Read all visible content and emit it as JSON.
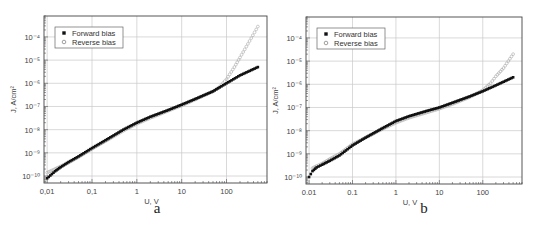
{
  "figure": {
    "panels": [
      "a",
      "b"
    ]
  },
  "chart_data": [
    {
      "type": "scatter",
      "panel_label": "a",
      "title": "",
      "xlabel": "U, V",
      "ylabel": "J, A/cm²",
      "xscale": "log",
      "yscale": "log",
      "xlim": [
        0.0085,
        800
      ],
      "ylim": [
        5e-11,
        0.0008
      ],
      "x_ticks": [
        0.01,
        0.1,
        1,
        10,
        100
      ],
      "x_tick_labels": [
        "0,01",
        "0,1",
        "1",
        "10",
        "100"
      ],
      "y_ticks": [
        1e-10,
        1e-09,
        1e-08,
        1e-07,
        1e-06,
        1e-05,
        0.0001
      ],
      "y_tick_labels": [
        "10⁻¹⁰",
        "10⁻⁹",
        "10⁻⁸",
        "10⁻⁷",
        "10⁻⁶",
        "10⁻⁵",
        "10⁻⁴"
      ],
      "grid": true,
      "legend_position": "upper left",
      "series": [
        {
          "name": "Forward bias",
          "marker": "filled-square",
          "color": "#111111",
          "x": [
            0.01,
            0.015,
            0.02,
            0.03,
            0.05,
            0.1,
            0.2,
            0.5,
            1,
            2,
            5,
            10,
            20,
            50,
            100,
            200,
            500
          ],
          "y": [
            8e-11,
            1.6e-10,
            2.4e-10,
            4e-10,
            7e-10,
            1.6e-09,
            3.5e-09,
            1e-08,
            2e-08,
            3.6e-08,
            7e-08,
            1.2e-07,
            2.1e-07,
            4.5e-07,
            1e-06,
            2.2e-06,
            5e-06
          ]
        },
        {
          "name": "Reverse bias",
          "marker": "open-circle",
          "color": "#aaaaaa",
          "x": [
            0.01,
            0.015,
            0.02,
            0.03,
            0.05,
            0.1,
            0.2,
            0.5,
            1,
            2,
            5,
            10,
            20,
            50,
            70,
            100,
            150,
            200,
            300,
            500
          ],
          "y": [
            1.4e-10,
            2e-10,
            2.6e-10,
            3.8e-10,
            6.5e-10,
            1.5e-09,
            3.2e-09,
            9e-09,
            1.8e-08,
            3.2e-08,
            6.5e-08,
            1.1e-07,
            2e-07,
            4.5e-07,
            7e-07,
            1.5e-06,
            5e-06,
            1.3e-05,
            5e-05,
            0.00028
          ]
        }
      ]
    },
    {
      "type": "scatter",
      "panel_label": "b",
      "title": "",
      "xlabel": "U, V",
      "ylabel": "J, A/cm²",
      "xscale": "log",
      "yscale": "log",
      "xlim": [
        0.0085,
        800
      ],
      "ylim": [
        5e-11,
        0.0008
      ],
      "x_ticks": [
        0.01,
        0.1,
        1,
        10,
        100
      ],
      "x_tick_labels": [
        "0.01",
        "0.1",
        "1",
        "10",
        "100"
      ],
      "y_ticks": [
        1e-10,
        1e-09,
        1e-08,
        1e-07,
        1e-06,
        1e-05,
        0.0001
      ],
      "y_tick_labels": [
        "10⁻¹⁰",
        "10⁻⁹",
        "10⁻⁸",
        "10⁻⁷",
        "10⁻⁶",
        "10⁻⁵",
        "10⁻⁴"
      ],
      "grid": true,
      "legend_position": "upper left",
      "series": [
        {
          "name": "Forward bias",
          "marker": "filled-square",
          "color": "#111111",
          "x": [
            0.01,
            0.012,
            0.015,
            0.02,
            0.03,
            0.05,
            0.1,
            0.2,
            0.5,
            1,
            2,
            5,
            10,
            20,
            50,
            100,
            200,
            500
          ],
          "y": [
            1e-10,
            1.8e-10,
            2.6e-10,
            3.4e-10,
            5e-10,
            8.5e-10,
            2.3e-09,
            5e-09,
            1.3e-08,
            2.6e-08,
            4.2e-08,
            7e-08,
            1e-07,
            1.6e-07,
            3e-07,
            5e-07,
            9e-07,
            2e-06
          ]
        },
        {
          "name": "Reverse bias",
          "marker": "open-circle",
          "color": "#aaaaaa",
          "x": [
            0.012,
            0.015,
            0.02,
            0.03,
            0.05,
            0.1,
            0.2,
            0.5,
            1,
            2,
            5,
            10,
            20,
            50,
            100,
            150,
            200,
            300,
            500
          ],
          "y": [
            2.4e-10,
            3e-10,
            3.8e-10,
            6e-10,
            1e-09,
            2.6e-09,
            5e-09,
            1.2e-08,
            2.2e-08,
            3.6e-08,
            6e-08,
            8.8e-08,
            1.4e-07,
            2.8e-07,
            5.5e-07,
            1.1e-06,
            2.2e-06,
            5e-06,
            2e-05
          ]
        }
      ]
    }
  ]
}
